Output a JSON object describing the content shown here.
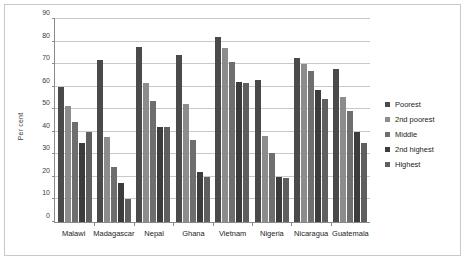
{
  "chart_data": {
    "type": "bar",
    "title": "",
    "subtitle": "",
    "xlabel": "",
    "ylabel": "Per cent",
    "ylim": [
      0,
      90
    ],
    "ytick_step": 10,
    "yticks": [
      0,
      10,
      20,
      30,
      40,
      50,
      60,
      70,
      80,
      90
    ],
    "grid": true,
    "legend_position": "right",
    "orientation": "vertical",
    "grouping": "clustered",
    "categories": [
      "Malawi",
      "Madagascar",
      "Nepal",
      "Ghana",
      "Vietnam",
      "Nigeria",
      "Nicaragua",
      "Guatemala"
    ],
    "series": [
      {
        "name": "Poorest",
        "color": "#4a4a4a",
        "values": [
          60,
          72,
          77.5,
          74,
          82,
          63,
          72.5,
          68
        ]
      },
      {
        "name": "2nd poorest",
        "color": "#8c8c8c",
        "values": [
          51.5,
          37.5,
          61.5,
          52.5,
          77,
          38,
          70,
          55.5
        ]
      },
      {
        "name": "Middle",
        "color": "#6e6e6e",
        "values": [
          44.5,
          24.5,
          53.5,
          36.5,
          71,
          30.5,
          67,
          49
        ]
      },
      {
        "name": "2nd highest",
        "color": "#3c3c3c",
        "values": [
          35,
          17.5,
          42,
          22,
          62,
          20,
          58.5,
          40
        ]
      },
      {
        "name": "Highest",
        "color": "#5f5f5f",
        "values": [
          40,
          10,
          42,
          20,
          61.5,
          19.5,
          54.5,
          35
        ]
      }
    ]
  },
  "legend": {
    "items": [
      {
        "label": "Poorest",
        "color": "#4a4a4a"
      },
      {
        "label": "2nd poorest",
        "color": "#8c8c8c"
      },
      {
        "label": "Middle",
        "color": "#6e6e6e"
      },
      {
        "label": "2nd highest",
        "color": "#3c3c3c"
      },
      {
        "label": "Highest",
        "color": "#5f5f5f"
      }
    ]
  },
  "axes": {
    "y_title": "Per cent"
  }
}
